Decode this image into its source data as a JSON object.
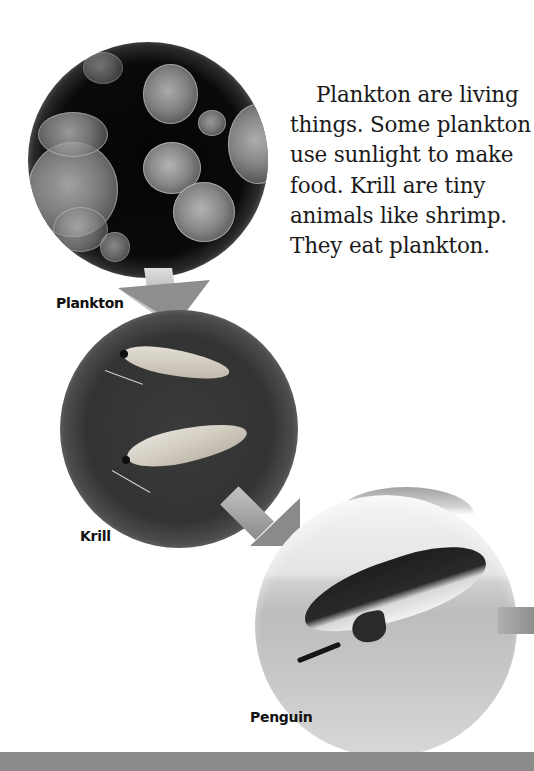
{
  "page": {
    "body_text": "Plankton are living things. Some plankton use sunlight to make food. Krill are tiny animals like shrimp. They eat plankton.",
    "body_lines": [
      "Plankton are living",
      "things. Some plankton",
      "use sunlight to make",
      "food. Krill are tiny",
      "animals like shrimp.",
      "They eat plankton."
    ]
  },
  "food_chain": {
    "stages": [
      {
        "label": "Plankton",
        "image": "plankton-photo"
      },
      {
        "label": "Krill",
        "image": "krill-photo"
      },
      {
        "label": "Penguin",
        "image": "penguin-photo"
      }
    ],
    "arrows": [
      "arrow-plankton-to-krill",
      "arrow-krill-to-penguin",
      "arrow-penguin-onward"
    ]
  },
  "colors": {
    "text": "#1a1a1a",
    "label": "#111111",
    "arrow": "#8e8e8e",
    "bottom_bar": "#8b8b8b",
    "background": "#ffffff"
  }
}
